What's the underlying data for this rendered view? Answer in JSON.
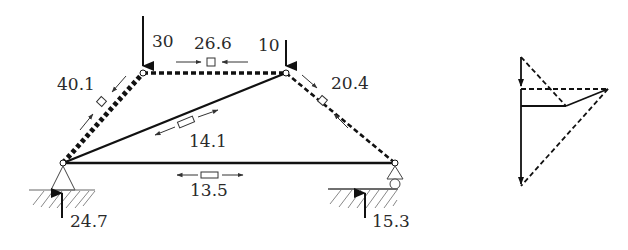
{
  "figure": {
    "truss": {
      "nodes": [
        {
          "id": "A",
          "role": "bottom-left pin support"
        },
        {
          "id": "B",
          "role": "top-left joint"
        },
        {
          "id": "C",
          "role": "top-right joint"
        },
        {
          "id": "D",
          "role": "bottom-right roller support"
        }
      ],
      "loads": [
        {
          "node": "B",
          "value": "30",
          "direction": "down"
        },
        {
          "node": "C",
          "value": "10",
          "direction": "down"
        }
      ],
      "reactions": [
        {
          "node": "A",
          "value": "24.7",
          "direction": "up"
        },
        {
          "node": "D",
          "value": "15.3",
          "direction": "up"
        }
      ],
      "members": [
        {
          "id": "AB",
          "force": "40.1",
          "type": "compression"
        },
        {
          "id": "BC",
          "force": "26.6",
          "type": "compression"
        },
        {
          "id": "CD",
          "force": "20.4",
          "type": "compression"
        },
        {
          "id": "AC",
          "force": "14.1",
          "type": "tension"
        },
        {
          "id": "AD",
          "force": "13.5",
          "type": "tension"
        }
      ],
      "legend_note": "dashed = compression, solid = tension"
    },
    "force_polygon": {
      "description": "Cremona / Maxwell force diagram",
      "segments": [
        {
          "label": "load 30",
          "style": "solid-arrow"
        },
        {
          "label": "load 10",
          "style": "solid-arrow"
        },
        {
          "label": "member BC",
          "style": "dashed"
        },
        {
          "label": "member AB",
          "style": "dashed"
        },
        {
          "label": "member CD",
          "style": "dashed"
        },
        {
          "label": "member AC",
          "style": "solid"
        },
        {
          "label": "member AD",
          "style": "solid"
        }
      ]
    }
  }
}
